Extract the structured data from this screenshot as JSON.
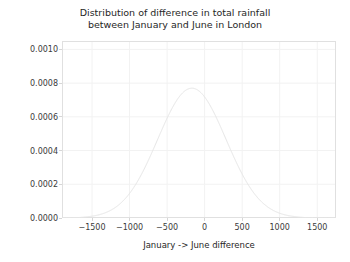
{
  "chart_data": {
    "type": "line",
    "title": "Distribution of difference in total rainfall\nbetween January and June in London",
    "title_line_1": "Distribution of difference in total rainfall",
    "title_line_2": "between January and June in London",
    "xlabel": "January -> June difference",
    "ylabel": "",
    "xlim": [
      -1900,
      1750
    ],
    "ylim": [
      0.0,
      0.00105
    ],
    "xticks": [
      -1500,
      -1000,
      -500,
      0,
      500,
      1000,
      1500
    ],
    "xtick_labels": [
      "−1500",
      "−1000",
      "−500",
      "0",
      "500",
      "1000",
      "1500"
    ],
    "yticks": [
      0.0,
      0.0002,
      0.0004,
      0.0006,
      0.0008,
      0.001
    ],
    "ytick_labels": [
      "0.0000",
      "0.0002",
      "0.0004",
      "0.0006",
      "0.0008",
      "0.0010"
    ],
    "grid": true,
    "legend": null,
    "distribution": {
      "kind": "normal-pdf",
      "mean": -170,
      "sigma": 455,
      "peak_value": 0.00077,
      "peak_x": -170
    },
    "series": [
      {
        "name": "rainfall difference density",
        "color": "#e6e6e6",
        "linewidth": 1.0,
        "x": [
          -1900,
          -1800,
          -1700,
          -1600,
          -1500,
          -1400,
          -1300,
          -1200,
          -1100,
          -1000,
          -900,
          -800,
          -700,
          -600,
          -500,
          -400,
          -300,
          -200,
          -170,
          -100,
          0,
          100,
          200,
          300,
          400,
          500,
          600,
          700,
          800,
          900,
          1000,
          1100,
          1200,
          1300,
          1400,
          1500,
          1600,
          1750
        ],
        "values": [
          3e-07,
          1e-06,
          2.9e-06,
          7.6e-06,
          1.81e-05,
          3.89e-05,
          7.57e-05,
          0.0001333,
          0.0002124,
          0.0003065,
          0.0004005,
          0.0004743,
          0.000509,
          0.0004943,
          0.0004337,
          0.0003448,
          0.0002481,
          0.0001616,
          0.0001352,
          9.54e-05,
          5.11e-05,
          2.48e-05,
          1.09e-05,
          4.3e-06,
          1.5e-06,
          5e-07,
          2e-07,
          5e-08,
          1e-08,
          2e-09,
          4e-10,
          1e-10,
          2e-11,
          3e-12,
          4e-13,
          5e-14,
          6e-15,
          3e-16
        ]
      }
    ],
    "colors": {
      "line": "#e6e6e6",
      "grid": "#f2f2f2",
      "spine": "#e0e0e0",
      "background": "#ffffff",
      "text": "#262626",
      "tick_text": "#3b3b3b"
    }
  }
}
